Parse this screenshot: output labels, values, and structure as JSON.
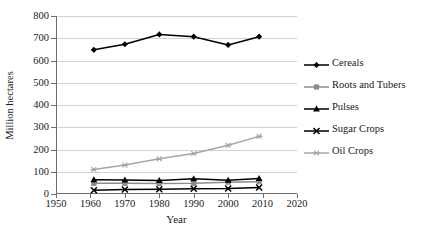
{
  "chart_data": {
    "type": "line",
    "title": "",
    "xlabel": "Year",
    "ylabel": "Million hectares",
    "xlim": [
      1950,
      2020
    ],
    "ylim": [
      0,
      800
    ],
    "xticks": [
      1950,
      1960,
      1970,
      1980,
      1990,
      2000,
      2010,
      2020
    ],
    "yticks": [
      0,
      100,
      200,
      300,
      400,
      500,
      600,
      700,
      800
    ],
    "grid": "horizontal",
    "legend_position": "right",
    "x": [
      1961,
      1970,
      1980,
      1990,
      2000,
      2009
    ],
    "series": [
      {
        "name": "Cereals",
        "values": [
          648,
          673,
          717,
          707,
          670,
          707
        ],
        "color": "#000000",
        "marker": "diamond"
      },
      {
        "name": "Roots and Tubers",
        "values": [
          48,
          48,
          47,
          48,
          53,
          55
        ],
        "color": "#8c8c8c",
        "marker": "square"
      },
      {
        "name": "Pulses",
        "values": [
          64,
          63,
          61,
          69,
          62,
          70
        ],
        "color": "#000000",
        "marker": "triangle"
      },
      {
        "name": "Sugar Crops",
        "values": [
          17,
          20,
          21,
          24,
          25,
          29
        ],
        "color": "#000000",
        "marker": "x"
      },
      {
        "name": "Oil Crops",
        "values": [
          110,
          130,
          158,
          182,
          219,
          259
        ],
        "color": "#a6a6a6",
        "marker": "asterisk"
      }
    ]
  },
  "legend": {
    "items": [
      {
        "label": "Cereals"
      },
      {
        "label": "Roots and Tubers"
      },
      {
        "label": "Pulses"
      },
      {
        "label": "Sugar Crops"
      },
      {
        "label": "Oil Crops"
      }
    ]
  },
  "axes": {
    "x_title": "Year",
    "y_title": "Million hectares"
  }
}
